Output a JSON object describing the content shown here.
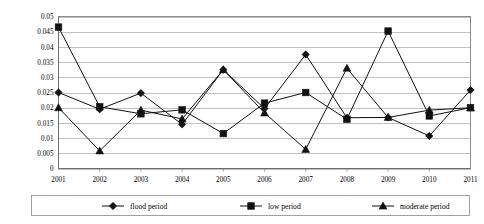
{
  "chart_data": {
    "type": "line",
    "title": "",
    "subtitle": "",
    "xlabel": "",
    "ylabel": "",
    "grid": true,
    "legend_position": "bottom",
    "categories": [
      "2001",
      "2002",
      "2003",
      "2004",
      "2005",
      "2006",
      "2007",
      "2008",
      "2009",
      "2010",
      "2011"
    ],
    "x": [
      2001,
      2002,
      2003,
      2004,
      2005,
      2006,
      2007,
      2008,
      2009,
      2010,
      2011
    ],
    "xlim": [
      2001,
      2011
    ],
    "ylim": [
      0,
      0.05
    ],
    "ytick_labels": [
      "0",
      "0.005",
      "0.01",
      "0.015",
      "0.02",
      "0.025",
      "0.03",
      "0.035",
      "0.04",
      "0.045",
      "0.05"
    ],
    "ytick_values": [
      0,
      0.005,
      0.01,
      0.015,
      0.02,
      0.025,
      0.03,
      0.035,
      0.04,
      0.045,
      0.05
    ],
    "series": [
      {
        "name": "flood period",
        "marker": "diamond",
        "values": [
          0.025,
          0.0195,
          0.0248,
          0.0145,
          0.0325,
          0.0197,
          0.0375,
          0.0167,
          0.0168,
          0.0107,
          0.0258
        ]
      },
      {
        "name": "low period",
        "marker": "square",
        "values": [
          0.0465,
          0.0203,
          0.018,
          0.0193,
          0.0115,
          0.0215,
          0.025,
          0.0162,
          0.0452,
          0.0173,
          0.02
        ]
      },
      {
        "name": "moderate period",
        "marker": "triangle",
        "values": [
          0.02,
          0.0058,
          0.0192,
          0.0163,
          0.0325,
          0.0183,
          0.0063,
          0.033,
          0.0168,
          0.0192,
          0.02
        ]
      }
    ],
    "legend": [
      {
        "label": "flood period",
        "marker": "diamond"
      },
      {
        "label": "low period",
        "marker": "square"
      },
      {
        "label": "moderate period",
        "marker": "triangle"
      }
    ]
  }
}
